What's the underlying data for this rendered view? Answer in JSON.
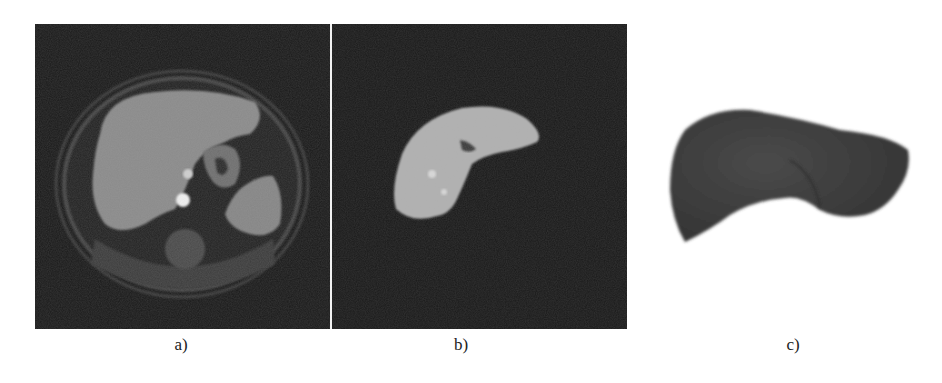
{
  "figure": {
    "panels": [
      {
        "id": "a",
        "caption": "a)",
        "description": "Axial abdominal MRI slice showing liver, stomach, spleen, aorta and spine",
        "background_color": "#191919",
        "tissue_color": "#8a8a8a"
      },
      {
        "id": "b",
        "caption": "b)",
        "description": "Segmented liver region isolated on dark background",
        "background_color": "#191919",
        "tissue_color": "#b0b0b0"
      },
      {
        "id": "c",
        "caption": "c)",
        "description": "3D surface rendering of the liver",
        "background_color": "#ffffff",
        "tissue_color": "#3e3e3e"
      }
    ],
    "divider_color": "#f2f2f2"
  }
}
